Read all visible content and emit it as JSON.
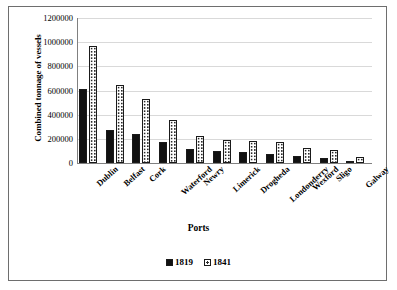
{
  "chart_data": {
    "type": "bar",
    "title": "",
    "xlabel": "Ports",
    "ylabel": "Combined tonnage of vessels",
    "ylim": [
      0,
      1200000
    ],
    "ytick_step": 200000,
    "yticks": [
      "1200000",
      "1000000",
      "800000",
      "600000",
      "400000",
      "200000",
      "0"
    ],
    "grid": true,
    "legend_position": "bottom",
    "categories": [
      "Dublin",
      "Belfast",
      "Cork",
      "Waterford",
      "Newry",
      "Limerick",
      "Drogheda",
      "Londonderry",
      "Wexford",
      "Sligo",
      "Galway"
    ],
    "series": [
      {
        "name": "1819",
        "values": [
          615000,
          271000,
          243000,
          173000,
          112000,
          98000,
          95000,
          76000,
          55000,
          38000,
          18000
        ]
      },
      {
        "name": "1841",
        "values": [
          970000,
          642000,
          530000,
          358000,
          223000,
          190000,
          182000,
          170000,
          125000,
          105000,
          48000
        ]
      }
    ]
  },
  "legend": {
    "entries": [
      {
        "label": "1819",
        "swatch": "solid-black-square-icon"
      },
      {
        "label": "1841",
        "swatch": "dotted-white-square-icon"
      }
    ]
  }
}
